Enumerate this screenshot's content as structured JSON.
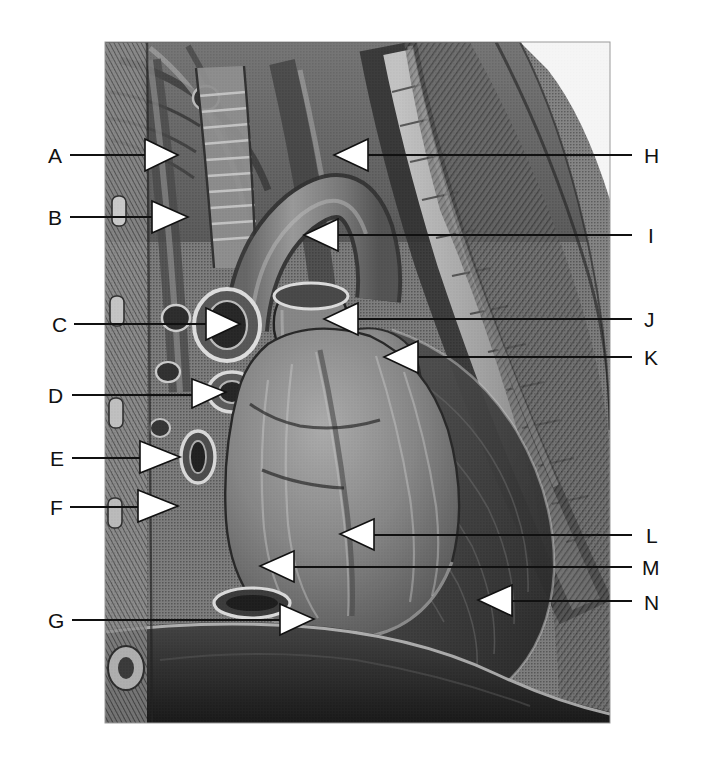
{
  "figure": {
    "kind": "anatomical-illustration",
    "rendering": "grayscale halftone engraving",
    "background_color": "#ffffff",
    "line_color": "#111111",
    "arrowhead_fill": "#ffffff",
    "image_panel": {
      "x": 105,
      "y": 42,
      "width": 505,
      "height": 681
    }
  },
  "labels_left": [
    {
      "id": "A",
      "text": "A",
      "label_x": 48,
      "label_y": 163,
      "line_x1": 70,
      "line_x2": 145,
      "line_y": 155,
      "arrow_tip_x": 178,
      "arrow_tip_y": 155
    },
    {
      "id": "B",
      "text": "B",
      "label_x": 48,
      "label_y": 225,
      "line_x1": 70,
      "line_x2": 152,
      "line_y": 217,
      "arrow_tip_x": 188,
      "arrow_tip_y": 217
    },
    {
      "id": "C",
      "text": "C",
      "label_x": 52,
      "label_y": 332,
      "line_x1": 74,
      "line_x2": 200,
      "line_y": 324,
      "arrow_tip_x": 238,
      "arrow_tip_y": 324
    },
    {
      "id": "D",
      "text": "D",
      "label_x": 48,
      "label_y": 403,
      "line_x1": 72,
      "line_x2": 190,
      "line_y": 395,
      "arrow_tip_x": 224,
      "arrow_tip_y": 392
    },
    {
      "id": "E",
      "text": "E",
      "label_x": 50,
      "label_y": 466,
      "line_x1": 72,
      "line_x2": 135,
      "line_y": 458,
      "arrow_tip_x": 178,
      "arrow_tip_y": 456
    },
    {
      "id": "F",
      "text": "F",
      "label_x": 50,
      "label_y": 515,
      "line_x1": 70,
      "line_x2": 135,
      "line_y": 507,
      "arrow_tip_x": 176,
      "arrow_tip_y": 505
    },
    {
      "id": "G",
      "text": "G",
      "label_x": 48,
      "label_y": 628,
      "line_x1": 72,
      "line_x2": 278,
      "line_y": 620,
      "arrow_tip_x": 312,
      "arrow_tip_y": 618
    }
  ],
  "labels_right": [
    {
      "id": "H",
      "text": "H",
      "label_x": 644,
      "label_y": 163,
      "line_x1": 632,
      "line_x2": 372,
      "line_y": 155,
      "arrow_tip_x": 334,
      "arrow_tip_y": 155
    },
    {
      "id": "I",
      "text": "I",
      "label_x": 648,
      "label_y": 243,
      "line_x1": 632,
      "line_x2": 340,
      "line_y": 235,
      "arrow_tip_x": 306,
      "arrow_tip_y": 235
    },
    {
      "id": "J",
      "text": "J",
      "label_x": 644,
      "label_y": 327,
      "line_x1": 632,
      "line_x2": 360,
      "line_y": 319,
      "arrow_tip_x": 326,
      "arrow_tip_y": 319
    },
    {
      "id": "K",
      "text": "K",
      "label_x": 644,
      "label_y": 365,
      "line_x1": 632,
      "line_x2": 420,
      "line_y": 357,
      "arrow_tip_x": 386,
      "arrow_tip_y": 357
    },
    {
      "id": "L",
      "text": "L",
      "label_x": 646,
      "label_y": 543,
      "line_x1": 632,
      "line_x2": 376,
      "line_y": 535,
      "arrow_tip_x": 342,
      "arrow_tip_y": 533
    },
    {
      "id": "M",
      "text": "M",
      "label_x": 642,
      "label_y": 575,
      "line_x1": 632,
      "line_x2": 296,
      "line_y": 567,
      "arrow_tip_x": 262,
      "arrow_tip_y": 565
    },
    {
      "id": "N",
      "text": "N",
      "label_x": 644,
      "label_y": 610,
      "line_x1": 632,
      "line_x2": 512,
      "line_y": 601,
      "arrow_tip_x": 480,
      "arrow_tip_y": 600
    }
  ],
  "callout_count": 14,
  "palette": {
    "ink": "#111111",
    "paper": "#ffffff",
    "tone_light": "#c9c9c9",
    "tone_mid": "#8d8d8d",
    "tone_dark": "#555555",
    "tone_deep": "#2b2b2b"
  }
}
